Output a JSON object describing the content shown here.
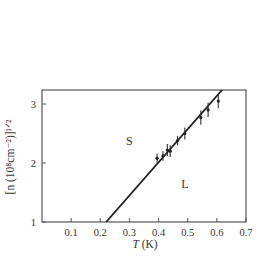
{
  "chart_data": {
    "type": "line",
    "title": "",
    "xlabel": "T (K)",
    "ylabel": "[n (10^8 cm^-2)]^1/2",
    "xlim": [
      0.0,
      0.7
    ],
    "ylim": [
      1.0,
      3.25
    ],
    "x_ticks": [
      0.1,
      0.2,
      0.3,
      0.4,
      0.5,
      0.6,
      0.7
    ],
    "x_tick_labels": [
      "0.1",
      "0.2",
      "0.3",
      "0.4",
      "0.5",
      "0.6",
      "0.7"
    ],
    "y_ticks": [
      1,
      2,
      3
    ],
    "y_tick_labels": [
      "1",
      "2",
      "3"
    ],
    "grid": false,
    "legend": null,
    "series": [
      {
        "name": "Melting line (fit)",
        "style": "line",
        "x": [
          0.22,
          0.62
        ],
        "y": [
          1.0,
          3.25
        ]
      },
      {
        "name": "Measured points",
        "style": "errorbar",
        "x": [
          0.395,
          0.415,
          0.43,
          0.44,
          0.465,
          0.49,
          0.545,
          0.57,
          0.605
        ],
        "y": [
          2.08,
          2.12,
          2.22,
          2.2,
          2.38,
          2.5,
          2.77,
          2.9,
          3.05
        ],
        "yerr": [
          0.08,
          0.08,
          0.1,
          0.1,
          0.08,
          0.1,
          0.12,
          0.12,
          0.12
        ]
      }
    ],
    "annotations": [
      {
        "text": "S",
        "x": 0.3,
        "y": 2.3
      },
      {
        "text": "L",
        "x": 0.49,
        "y": 1.58
      }
    ]
  },
  "labels": {
    "x_axis_title_italic": "T",
    "x_axis_title_unit": " (K)",
    "y_axis_title": "[n (10⁸cm⁻²)]¹ᐟ²",
    "region_solid": "S",
    "region_liquid": "L"
  }
}
